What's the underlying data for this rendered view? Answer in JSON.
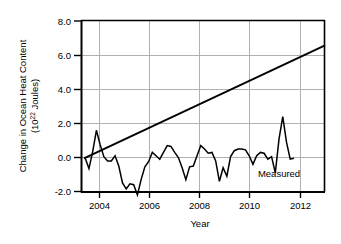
{
  "chart_data": {
    "type": "line",
    "title": "",
    "xlabel": "Year",
    "ylabel_line1": "Change in Ocean Heat Content",
    "ylabel_line2_prefix": "(10",
    "ylabel_line2_sup": "22",
    "ylabel_line2_suffix": " Joules)",
    "ylabel_full": "Change in Ocean Heat Content (10^22 Joules)",
    "xlim": [
      2003.2,
      2013.0
    ],
    "ylim": [
      -2.6,
      8.0
    ],
    "xticks": [
      2004,
      2006,
      2008,
      2010,
      2012
    ],
    "xtick_labels": [
      "2004",
      "2006",
      "2008",
      "2010",
      "2012"
    ],
    "yticks": [
      -2.0,
      0.0,
      2.0,
      4.0,
      6.0,
      8.0
    ],
    "ytick_labels": [
      "-2.0",
      "0.0",
      "2.0",
      "4.0",
      "6.0",
      "8.0"
    ],
    "grid": "both-major-light-gray",
    "legend_position": "inline-annotation",
    "series": [
      {
        "name": "Measured",
        "style": "jagged-line",
        "color": "#000000",
        "annotation": "Measured",
        "annotation_x": 2010.3,
        "annotation_y": -0.95,
        "x": [
          2003.35,
          2003.5,
          2003.65,
          2003.8,
          2003.95,
          2004.1,
          2004.25,
          2004.4,
          2004.55,
          2004.7,
          2004.85,
          2005.0,
          2005.15,
          2005.3,
          2005.45,
          2005.6,
          2005.75,
          2005.9,
          2006.05,
          2006.2,
          2006.35,
          2006.5,
          2006.65,
          2006.8,
          2006.95,
          2007.1,
          2007.25,
          2007.4,
          2007.55,
          2007.7,
          2007.85,
          2008.0,
          2008.15,
          2008.3,
          2008.45,
          2008.6,
          2008.75,
          2008.9,
          2009.05,
          2009.2,
          2009.35,
          2009.5,
          2009.65,
          2009.8,
          2009.95,
          2010.1,
          2010.25,
          2010.4,
          2010.55,
          2010.7,
          2010.85,
          2011.0,
          2011.15,
          2011.3,
          2011.45,
          2011.6,
          2011.75
        ],
        "y": [
          -0.05,
          -0.65,
          0.35,
          1.6,
          0.75,
          0.05,
          -0.2,
          -0.2,
          0.1,
          -0.5,
          -1.5,
          -1.85,
          -1.55,
          -1.6,
          -2.2,
          -1.3,
          -0.55,
          -0.25,
          0.3,
          0.1,
          -0.1,
          0.3,
          0.7,
          0.65,
          0.3,
          0.0,
          -0.6,
          -1.3,
          -0.55,
          -0.5,
          0.1,
          0.7,
          0.5,
          0.25,
          0.3,
          -0.2,
          -1.4,
          -0.6,
          -1.1,
          0.05,
          0.4,
          0.5,
          0.5,
          0.45,
          0.1,
          -0.4,
          0.1,
          0.3,
          0.25,
          -0.1,
          0.05,
          -0.9,
          1.1,
          2.4,
          0.9,
          -0.1,
          -0.05
        ]
      },
      {
        "name": "Trend",
        "style": "straight-line",
        "color": "#000000",
        "x": [
          2003.3,
          2013.0
        ],
        "y": [
          -0.05,
          6.6
        ]
      }
    ]
  }
}
